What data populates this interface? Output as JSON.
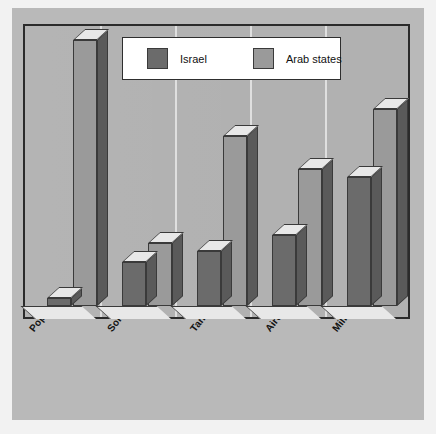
{
  "chart_data": {
    "type": "bar",
    "title": "",
    "subtitle": "",
    "xlabel": "",
    "ylabel": "",
    "ylim": [
      0,
      100
    ],
    "grid": true,
    "legend_position": "top-center",
    "style": "3d-clustered-column",
    "categories": [
      "Population",
      "Soldiers",
      "Tanks",
      "Aircraft",
      "Military expenditure"
    ],
    "series": [
      {
        "name": "Israel",
        "color": "#6b6b6b",
        "values": [
          3,
          16,
          20,
          26,
          47
        ]
      },
      {
        "name": "Arab states",
        "color": "#9a9a9a",
        "values": [
          97,
          23,
          62,
          50,
          72
        ]
      }
    ]
  },
  "legend": {
    "entries": [
      {
        "label": "Israel",
        "swatch_color": "#6b6b6b",
        "icon": "legend-swatch-icon"
      },
      {
        "label": "Arab states",
        "swatch_color": "#9a9a9a",
        "icon": "legend-swatch-icon"
      }
    ]
  },
  "axis": {
    "categories": [
      "Population",
      "Soldiers",
      "Tanks",
      "Aircraft",
      "Military expenditure"
    ]
  },
  "colors": {
    "figure_background": "#f2f2f2",
    "plot_background": "#b1b1b1",
    "canvas_background": "#b9b9b9",
    "gridline": "#e2e2e2",
    "border": "#2b2b2b",
    "series_israel": "#6b6b6b",
    "series_arab": "#9a9a9a",
    "bar_top_light": "#e8e8e8",
    "bar_side_dark": "#5a5a5a",
    "text": "#131313"
  }
}
